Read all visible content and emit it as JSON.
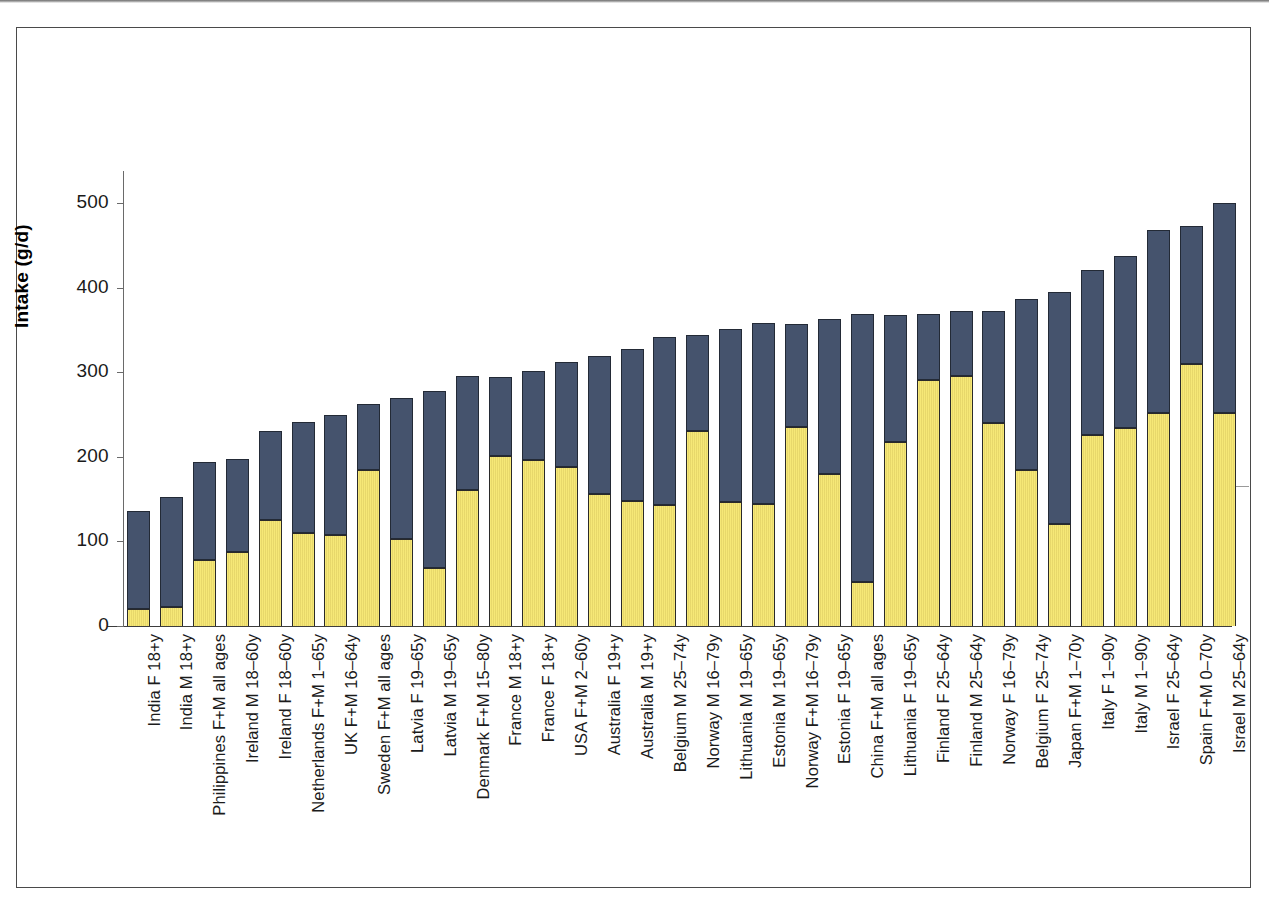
{
  "chart_data": {
    "type": "bar",
    "subtype": "stacked-bar",
    "title": "",
    "xlabel": "",
    "ylabel": "Intake (g/d)",
    "ylim": [
      0,
      520
    ],
    "yticks": [
      0,
      100,
      200,
      300,
      400,
      500
    ],
    "ytick_labels": [
      "0",
      "100",
      "200",
      "300",
      "400",
      "500"
    ],
    "grid": false,
    "legend": "none",
    "series": [
      {
        "name": "lower-segment",
        "color": "#f6e877",
        "values": [
          20,
          22,
          78,
          87,
          125,
          110,
          108,
          184,
          103,
          69,
          161,
          201,
          196,
          188,
          156,
          148,
          143,
          231,
          146,
          144,
          235,
          180,
          52,
          218,
          291,
          295,
          240,
          185,
          120,
          226,
          234,
          252,
          310,
          252
        ]
      },
      {
        "name": "upper-segment",
        "color": "#45536d",
        "values": [
          116,
          131,
          116,
          110,
          106,
          131,
          142,
          78,
          167,
          209,
          135,
          93,
          106,
          124,
          163,
          180,
          199,
          113,
          205,
          214,
          122,
          183,
          317,
          150,
          78,
          77,
          132,
          201,
          275,
          195,
          203,
          216,
          163,
          248
        ]
      }
    ],
    "totals": [
      136,
      153,
      194,
      197,
      231,
      241,
      250,
      262,
      270,
      278,
      296,
      294,
      302,
      312,
      319,
      328,
      342,
      344,
      351,
      358,
      357,
      363,
      369,
      368,
      369,
      372,
      372,
      386,
      395,
      421,
      437,
      468,
      472,
      500
    ],
    "categories": [
      "India F 18+y",
      "India M 18+y",
      "Philippines F+M all ages",
      "Ireland M 18–60y",
      "Ireland F 18–60y",
      "Netherlands F+M 1–65y",
      "UK F+M 16–64y",
      "Sweden F+M all ages",
      "Latvia F 19–65y",
      "Latvia M 19–65y",
      "Denmark F+M 15–80y",
      "France M 18+y",
      "France F 18+y",
      "USA F+M 2–60y",
      "Australia F 19+y",
      "Australia M 19+y",
      "Belgium M 25–74y",
      "Norway M 16–79y",
      "Lithuania M 19–65y",
      "Estonia M 19–65y",
      "Norway F+M 16–79y",
      "Estonia F 19–65y",
      "China F+M all ages",
      "Lithuania F 19–65y",
      "Finland F 25–64y",
      "Finland M 25–64y",
      "Norway F 16–79y",
      "Belgium F 25–74y",
      "Japan F+M 1–70y",
      "Italy F 1–90y",
      "Italy M 1–90y",
      "Israel F 25–64y",
      "Spain F+M 0–70y",
      "Israel M 25–64y"
    ]
  }
}
